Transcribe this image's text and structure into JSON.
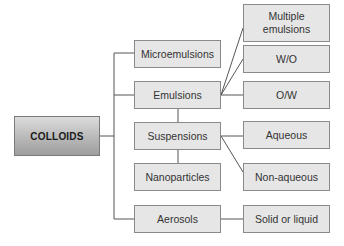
{
  "diagram": {
    "type": "tree",
    "colors": {
      "box_fill": "#e6e6e6",
      "box_border": "#8a8a8a",
      "line": "#555555",
      "text": "#333333",
      "root_gradient_top": "#dcdcdc",
      "root_gradient_bottom": "#9e9e9e"
    },
    "root": {
      "label": "COLLOIDS"
    },
    "categories": [
      {
        "label": "Microemulsions"
      },
      {
        "label": "Emulsions"
      },
      {
        "label": "Suspensions"
      },
      {
        "label": "Nanoparticles"
      },
      {
        "label": "Aerosols"
      }
    ],
    "subtypes": [
      {
        "label": "Multiple emulsions",
        "parent": "Emulsions"
      },
      {
        "label": "W/O",
        "parent": "Emulsions"
      },
      {
        "label": "O/W",
        "parent": "Emulsions"
      },
      {
        "label": "Aqueous",
        "parent": "Suspensions"
      },
      {
        "label": "Non-aqueous",
        "parent": "Suspensions"
      },
      {
        "label": "Solid or liquid",
        "parent": "Aerosols"
      }
    ]
  }
}
